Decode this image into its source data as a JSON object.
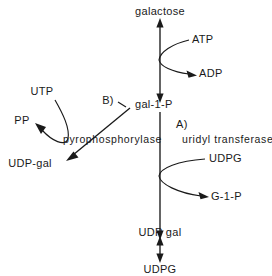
{
  "diagram": {
    "ink_color": "#1a1a1a",
    "background_color": "#ffffff",
    "metabolites": {
      "galactose": "galactose",
      "atp": "ATP",
      "adp": "ADP",
      "gal_1_p": "gal-1-P",
      "utp": "UTP",
      "pp": "PP",
      "udp_gal_left": "UDP-gal",
      "udpg_in": "UDPG",
      "g_1_p": "G-1-P",
      "udp_gal_bottom": "UDP gal",
      "udpg_bottom": "UDPG"
    },
    "enzymes": {
      "marker_a": "A)",
      "enzyme_a": "uridyl transferase",
      "marker_b": "B)",
      "enzyme_b": "pyrophosphorylase"
    }
  }
}
